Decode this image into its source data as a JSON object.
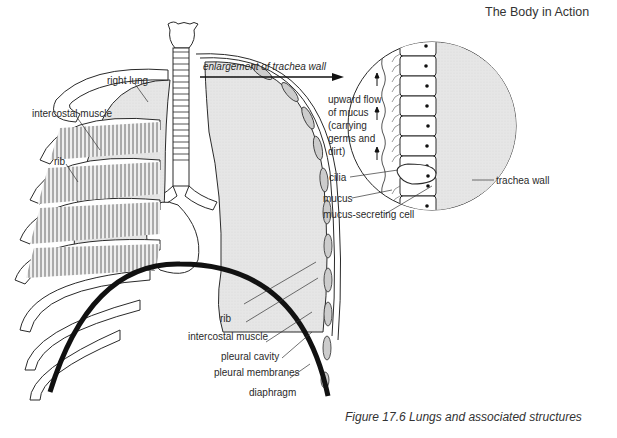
{
  "header": {
    "running_title": "The Body in Action"
  },
  "figure": {
    "caption": "Figure 17.6  Lungs and associated structures",
    "arrow_label": "enlargement of trachea wall"
  },
  "labels": {
    "right_lung": "right lung",
    "intercostal_muscle_top": "intercostal muscle",
    "rib_top": "rib",
    "rib_bottom": "rib",
    "intercostal_muscle_bottom": "intercostal muscle",
    "pleural_cavity": "pleural cavity",
    "pleural_membranes": "pleural membranes",
    "diaphragm": "diaphragm"
  },
  "inset": {
    "flow_text": [
      "upward flow",
      "of mucus",
      "(carrying",
      "germs and",
      "dirt)"
    ],
    "cilia": "cilia",
    "mucus": "mucus",
    "mucus_secreting_cell": "mucus-secreting cell",
    "trachea_wall": "trachea wall"
  },
  "colors": {
    "line": "#2a2a2a",
    "lung_fill": "#e4e4e4",
    "diaphragm": "#111111",
    "background": "#ffffff"
  }
}
